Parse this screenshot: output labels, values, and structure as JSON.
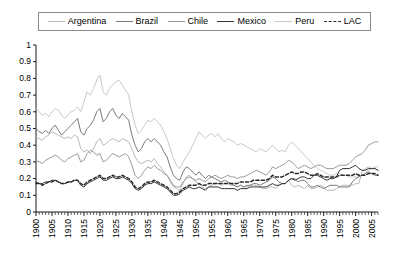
{
  "legend": {
    "position": "top",
    "items": [
      {
        "label": "Argentina",
        "color": "#b9b9b9",
        "dash": false
      },
      {
        "label": "Brazil",
        "color": "#7a7a7a",
        "dash": false
      },
      {
        "label": "Chile",
        "color": "#9a9a9a",
        "dash": false
      },
      {
        "label": "Mexico",
        "color": "#333333",
        "dash": false
      },
      {
        "label": "Peru",
        "color": "#c9c9c9",
        "dash": false
      },
      {
        "label": "LAC",
        "color": "#2b2b2b",
        "dash": true
      }
    ]
  },
  "axes": {
    "y_tick_labels": [
      "1",
      "0.9",
      "0.8",
      "0.7",
      "0.6",
      "0.5",
      "0.4",
      "0.3",
      "0.2",
      "0.1",
      "0"
    ],
    "x_tick_labels": [
      "1900",
      "1905",
      "1910",
      "1915",
      "1920",
      "1925",
      "1930",
      "1935",
      "1940",
      "1945",
      "1950",
      "1955",
      "1960",
      "1965",
      "1970",
      "1975",
      "1980",
      "1985",
      "1990",
      "1995",
      "2000",
      "2005"
    ]
  },
  "chart_data": {
    "type": "line",
    "title": "",
    "subtitle": "",
    "xlabel": "",
    "ylabel": "",
    "xlim": [
      1900,
      2007
    ],
    "ylim": [
      0,
      1
    ],
    "ytick_step": 0.1,
    "xtick_major_step": 5,
    "xtick_minor_step": 1,
    "grid": false,
    "legend_position": "top",
    "x": [
      1900,
      1901,
      1902,
      1903,
      1904,
      1905,
      1906,
      1907,
      1908,
      1909,
      1910,
      1911,
      1912,
      1913,
      1914,
      1915,
      1916,
      1917,
      1918,
      1919,
      1920,
      1921,
      1922,
      1923,
      1924,
      1925,
      1926,
      1927,
      1928,
      1929,
      1930,
      1931,
      1932,
      1933,
      1934,
      1935,
      1936,
      1937,
      1938,
      1939,
      1940,
      1941,
      1942,
      1943,
      1944,
      1945,
      1946,
      1947,
      1948,
      1949,
      1950,
      1951,
      1952,
      1953,
      1954,
      1955,
      1956,
      1957,
      1958,
      1959,
      1960,
      1961,
      1962,
      1963,
      1964,
      1965,
      1966,
      1967,
      1968,
      1969,
      1970,
      1971,
      1972,
      1973,
      1974,
      1975,
      1976,
      1977,
      1978,
      1979,
      1980,
      1981,
      1982,
      1983,
      1984,
      1985,
      1986,
      1987,
      1988,
      1989,
      1990,
      1991,
      1992,
      1993,
      1994,
      1995,
      1996,
      1997,
      1998,
      1999,
      2000,
      2001,
      2002,
      2003,
      2004,
      2005,
      2006,
      2007
    ],
    "series": [
      {
        "name": "Peru",
        "color": "#c9c9c9",
        "dash": false,
        "values": [
          0.62,
          0.6,
          0.58,
          0.59,
          0.57,
          0.6,
          0.62,
          0.61,
          0.58,
          0.56,
          0.58,
          0.6,
          0.61,
          0.63,
          0.6,
          0.66,
          0.72,
          0.7,
          0.74,
          0.79,
          0.82,
          0.72,
          0.7,
          0.74,
          0.76,
          0.78,
          0.79,
          0.76,
          0.73,
          0.7,
          0.6,
          0.52,
          0.47,
          0.49,
          0.52,
          0.55,
          0.54,
          0.56,
          0.54,
          0.52,
          0.48,
          0.44,
          0.38,
          0.32,
          0.28,
          0.26,
          0.3,
          0.33,
          0.36,
          0.4,
          0.44,
          0.48,
          0.46,
          0.44,
          0.46,
          0.47,
          0.45,
          0.47,
          0.44,
          0.42,
          0.44,
          0.43,
          0.42,
          0.4,
          0.41,
          0.4,
          0.39,
          0.38,
          0.37,
          0.36,
          0.38,
          0.37,
          0.36,
          0.38,
          0.4,
          0.38,
          0.36,
          0.37,
          0.36,
          0.4,
          0.42,
          0.4,
          0.38,
          0.36,
          0.34,
          0.32,
          0.3,
          0.28,
          0.26,
          0.25,
          0.24,
          0.23,
          0.22,
          0.22,
          0.23,
          0.23,
          0.22,
          0.22,
          0.21,
          0.21,
          0.21,
          0.21,
          0.22,
          0.23,
          0.25,
          0.26,
          0.27,
          0.27
        ]
      },
      {
        "name": "Argentina",
        "color": "#b9b9b9",
        "dash": false,
        "values": [
          0.45,
          0.44,
          0.43,
          0.45,
          0.46,
          0.48,
          0.47,
          0.46,
          0.45,
          0.44,
          0.45,
          0.44,
          0.46,
          0.45,
          0.38,
          0.36,
          0.37,
          0.35,
          0.38,
          0.42,
          0.44,
          0.4,
          0.41,
          0.43,
          0.44,
          0.43,
          0.42,
          0.44,
          0.43,
          0.42,
          0.38,
          0.33,
          0.3,
          0.29,
          0.3,
          0.31,
          0.3,
          0.32,
          0.29,
          0.27,
          0.24,
          0.22,
          0.18,
          0.15,
          0.14,
          0.13,
          0.17,
          0.21,
          0.22,
          0.2,
          0.18,
          0.17,
          0.15,
          0.14,
          0.15,
          0.16,
          0.17,
          0.17,
          0.16,
          0.17,
          0.17,
          0.16,
          0.16,
          0.15,
          0.16,
          0.15,
          0.15,
          0.16,
          0.16,
          0.16,
          0.15,
          0.14,
          0.14,
          0.15,
          0.15,
          0.14,
          0.16,
          0.17,
          0.17,
          0.19,
          0.16,
          0.15,
          0.16,
          0.15,
          0.14,
          0.16,
          0.14,
          0.14,
          0.15,
          0.16,
          0.15,
          0.13,
          0.13,
          0.13,
          0.14,
          0.15,
          0.16,
          0.16,
          0.16,
          0.16,
          0.17,
          0.17,
          0.24,
          0.26,
          0.27,
          0.26,
          0.26,
          0.25
        ]
      },
      {
        "name": "Brazil",
        "color": "#7a7a7a",
        "dash": false,
        "values": [
          0.5,
          0.48,
          0.47,
          0.49,
          0.47,
          0.5,
          0.52,
          0.49,
          0.46,
          0.48,
          0.5,
          0.52,
          0.54,
          0.56,
          0.48,
          0.46,
          0.5,
          0.52,
          0.55,
          0.6,
          0.62,
          0.54,
          0.56,
          0.6,
          0.62,
          0.58,
          0.56,
          0.59,
          0.57,
          0.55,
          0.46,
          0.4,
          0.36,
          0.38,
          0.42,
          0.44,
          0.42,
          0.44,
          0.42,
          0.4,
          0.36,
          0.33,
          0.27,
          0.22,
          0.2,
          0.19,
          0.24,
          0.27,
          0.26,
          0.24,
          0.22,
          0.24,
          0.22,
          0.2,
          0.22,
          0.21,
          0.2,
          0.19,
          0.18,
          0.19,
          0.18,
          0.17,
          0.16,
          0.15,
          0.16,
          0.15,
          0.16,
          0.16,
          0.17,
          0.17,
          0.16,
          0.17,
          0.18,
          0.19,
          0.21,
          0.2,
          0.18,
          0.17,
          0.17,
          0.19,
          0.2,
          0.2,
          0.18,
          0.19,
          0.19,
          0.17,
          0.15,
          0.15,
          0.16,
          0.15,
          0.14,
          0.15,
          0.16,
          0.16,
          0.16,
          0.15,
          0.15,
          0.15,
          0.15,
          0.18,
          0.2,
          0.21,
          0.22,
          0.23,
          0.24,
          0.23,
          0.22,
          0.22
        ]
      },
      {
        "name": "Chile",
        "color": "#9a9a9a",
        "dash": false,
        "values": [
          0.31,
          0.3,
          0.29,
          0.31,
          0.32,
          0.33,
          0.34,
          0.33,
          0.31,
          0.3,
          0.32,
          0.33,
          0.34,
          0.35,
          0.3,
          0.31,
          0.35,
          0.37,
          0.36,
          0.34,
          0.35,
          0.3,
          0.31,
          0.33,
          0.35,
          0.34,
          0.33,
          0.34,
          0.35,
          0.33,
          0.28,
          0.22,
          0.2,
          0.22,
          0.25,
          0.27,
          0.26,
          0.28,
          0.26,
          0.25,
          0.23,
          0.22,
          0.19,
          0.16,
          0.15,
          0.15,
          0.18,
          0.2,
          0.21,
          0.2,
          0.19,
          0.2,
          0.19,
          0.18,
          0.2,
          0.21,
          0.22,
          0.21,
          0.2,
          0.21,
          0.22,
          0.21,
          0.21,
          0.2,
          0.21,
          0.21,
          0.22,
          0.23,
          0.24,
          0.25,
          0.24,
          0.23,
          0.22,
          0.24,
          0.27,
          0.26,
          0.27,
          0.28,
          0.29,
          0.31,
          0.3,
          0.28,
          0.26,
          0.27,
          0.28,
          0.27,
          0.26,
          0.27,
          0.28,
          0.28,
          0.27,
          0.26,
          0.26,
          0.26,
          0.27,
          0.28,
          0.28,
          0.28,
          0.29,
          0.31,
          0.33,
          0.34,
          0.35,
          0.37,
          0.4,
          0.41,
          0.42,
          0.42
        ]
      },
      {
        "name": "Mexico",
        "color": "#333333",
        "dash": false,
        "values": [
          0.18,
          0.17,
          0.17,
          0.18,
          0.18,
          0.19,
          0.19,
          0.18,
          0.17,
          0.17,
          0.18,
          0.18,
          0.19,
          0.19,
          0.16,
          0.15,
          0.17,
          0.18,
          0.19,
          0.2,
          0.21,
          0.19,
          0.19,
          0.2,
          0.21,
          0.2,
          0.2,
          0.21,
          0.2,
          0.19,
          0.17,
          0.14,
          0.13,
          0.14,
          0.16,
          0.17,
          0.17,
          0.18,
          0.17,
          0.16,
          0.15,
          0.14,
          0.12,
          0.1,
          0.1,
          0.11,
          0.13,
          0.14,
          0.15,
          0.14,
          0.14,
          0.15,
          0.14,
          0.13,
          0.15,
          0.15,
          0.15,
          0.15,
          0.14,
          0.14,
          0.14,
          0.14,
          0.14,
          0.13,
          0.14,
          0.14,
          0.14,
          0.15,
          0.15,
          0.15,
          0.15,
          0.15,
          0.15,
          0.16,
          0.17,
          0.16,
          0.16,
          0.17,
          0.17,
          0.19,
          0.2,
          0.19,
          0.2,
          0.21,
          0.21,
          0.2,
          0.2,
          0.22,
          0.22,
          0.21,
          0.2,
          0.19,
          0.2,
          0.2,
          0.21,
          0.25,
          0.26,
          0.26,
          0.26,
          0.27,
          0.28,
          0.26,
          0.25,
          0.25,
          0.26,
          0.26,
          0.26,
          0.25
        ]
      },
      {
        "name": "LAC",
        "color": "#2b2b2b",
        "dash": true,
        "values": [
          0.17,
          0.17,
          0.16,
          0.17,
          0.18,
          0.18,
          0.19,
          0.18,
          0.17,
          0.17,
          0.18,
          0.18,
          0.19,
          0.19,
          0.17,
          0.16,
          0.18,
          0.19,
          0.2,
          0.21,
          0.22,
          0.2,
          0.2,
          0.21,
          0.22,
          0.21,
          0.21,
          0.22,
          0.21,
          0.2,
          0.18,
          0.15,
          0.14,
          0.15,
          0.17,
          0.18,
          0.18,
          0.19,
          0.18,
          0.17,
          0.16,
          0.15,
          0.13,
          0.11,
          0.11,
          0.12,
          0.14,
          0.15,
          0.16,
          0.16,
          0.16,
          0.17,
          0.16,
          0.16,
          0.17,
          0.17,
          0.17,
          0.17,
          0.17,
          0.17,
          0.17,
          0.17,
          0.17,
          0.17,
          0.18,
          0.18,
          0.18,
          0.18,
          0.19,
          0.19,
          0.19,
          0.19,
          0.19,
          0.2,
          0.22,
          0.21,
          0.21,
          0.21,
          0.22,
          0.23,
          0.24,
          0.23,
          0.23,
          0.24,
          0.24,
          0.23,
          0.22,
          0.22,
          0.23,
          0.22,
          0.21,
          0.21,
          0.21,
          0.21,
          0.21,
          0.22,
          0.22,
          0.22,
          0.22,
          0.22,
          0.23,
          0.22,
          0.22,
          0.22,
          0.23,
          0.23,
          0.23,
          0.22
        ]
      }
    ]
  }
}
